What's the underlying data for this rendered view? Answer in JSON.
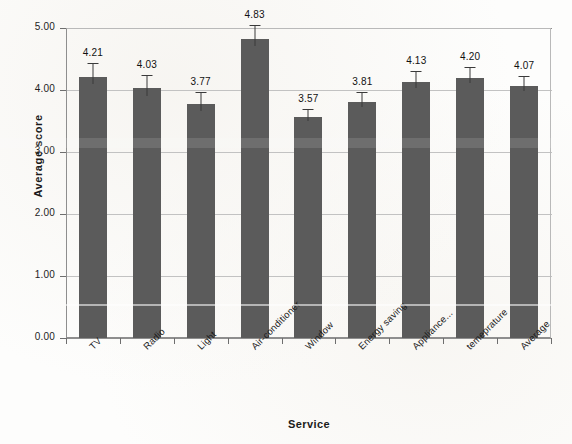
{
  "chart_data": {
    "type": "bar",
    "title": "",
    "xlabel": "Service",
    "ylabel": "Average score",
    "ylim": [
      0.0,
      5.0
    ],
    "ytick_step": 1.0,
    "ytick_labels": [
      "0.00",
      "1.00",
      "2.00",
      "3.00",
      "4.00",
      "5.00"
    ],
    "ytick_values": [
      0.0,
      1.0,
      2.0,
      3.0,
      4.0,
      5.0
    ],
    "grid": true,
    "legend": "none",
    "error_bars": true,
    "categories": [
      "TV",
      "Radio",
      "Light",
      "Air-conditioner",
      "Window",
      "Energy saving",
      "Appliance...",
      "temeprature",
      "Average"
    ],
    "values": [
      4.21,
      4.03,
      3.77,
      4.83,
      3.57,
      3.81,
      4.13,
      4.2,
      4.07
    ],
    "value_labels": [
      "4.21",
      "4.03",
      "3.77",
      "4.83",
      "3.57",
      "3.81",
      "4.13",
      "4.20",
      "4.07"
    ],
    "errors": [
      0.22,
      0.22,
      0.2,
      0.22,
      0.13,
      0.16,
      0.17,
      0.17,
      0.16
    ],
    "bar_color": "#5b5b5b",
    "error_color": "#3a3a3a",
    "grid_color": "#c2c2c2",
    "axis_color": "#8e8e8e",
    "text_color": "#1a1a1a",
    "background_color": "#fdfdfc"
  }
}
